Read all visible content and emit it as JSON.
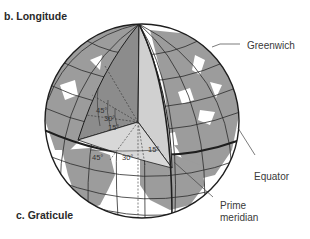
{
  "panels": {
    "longitude_title": "b. Longitude",
    "graticule_title": "c. Graticule"
  },
  "callouts": {
    "greenwich": "Greenwich",
    "equator": "Equator",
    "prime_meridian": "Prime\nmeridian",
    "prime_meridian_line1": "Prime",
    "prime_meridian_line2": "meridian"
  },
  "angles": {
    "latitude_side": [
      "45°",
      "30°",
      "15°"
    ],
    "longitude_side": [
      "45°",
      "30°",
      "15°"
    ]
  },
  "colors": {
    "land": "#9a9a9a",
    "ocean": "#ffffff",
    "cutaway_dark": "#8c8c8c",
    "cutaway_light": "#cfcfcf",
    "lines": "#2b2b2b"
  }
}
